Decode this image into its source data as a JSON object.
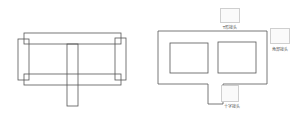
{
  "diagram": {
    "left_figure": {
      "description": "overlapping rectangular frame members with central vertical post"
    },
    "right_figure": {
      "description": "outline frame with two window openings and bottom tab"
    },
    "joints": [
      {
        "name": "t-joint",
        "label": "T形接头",
        "icon": "t-junction-icon"
      },
      {
        "name": "corner-joint",
        "label": "角部接头",
        "icon": "corner-junction-icon"
      },
      {
        "name": "cross-joint",
        "label": "十字接头",
        "icon": "cross-junction-icon"
      }
    ],
    "colors": {
      "stroke": "#555555",
      "icon_border": "#cfcfcf",
      "background": "#ffffff"
    }
  }
}
